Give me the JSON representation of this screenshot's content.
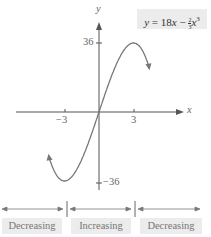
{
  "equation": {
    "lhs": "y",
    "eq": " = 18",
    "x": "x",
    "minus": " − ",
    "frac_num": "2",
    "frac_den": "3",
    "x3": "x",
    "exp": "3",
    "full": "y = 18x − (2/3)x^3"
  },
  "axes": {
    "x_label": "x",
    "y_label": "y",
    "x_tick_neg": "−3",
    "x_tick_pos": "3",
    "y_tick_pos": "36",
    "y_tick_neg": "−36"
  },
  "intervals": [
    {
      "label": "Decreasing"
    },
    {
      "label": "Increasing"
    },
    {
      "label": "Decreasing"
    }
  ],
  "colors": {
    "curve": "#777777",
    "axis": "#555555",
    "box": "#ececec"
  },
  "chart_data": {
    "type": "line",
    "xlabel": "x",
    "ylabel": "y",
    "x_ticks": [
      -3,
      3
    ],
    "y_ticks": [
      36,
      -36
    ],
    "xlim": [
      -4.3,
      4.3
    ],
    "ylim": [
      -42,
      45
    ],
    "series": [
      {
        "name": "y = 18x − (2/3)x^3",
        "x": [
          -4.3,
          -4,
          -3.5,
          -3,
          -2,
          -1,
          0,
          1,
          2,
          3,
          3.5,
          4,
          4.3
        ],
        "y": [
          -24.4,
          -29.3,
          -34.4,
          -36,
          -30.7,
          -17.3,
          0,
          17.3,
          30.7,
          36,
          34.4,
          29.3,
          24.4
        ]
      }
    ],
    "annotations": [
      "Decreasing on (−∞,−3)",
      "Increasing on (−3,3)",
      "Decreasing on (3,∞)"
    ]
  }
}
